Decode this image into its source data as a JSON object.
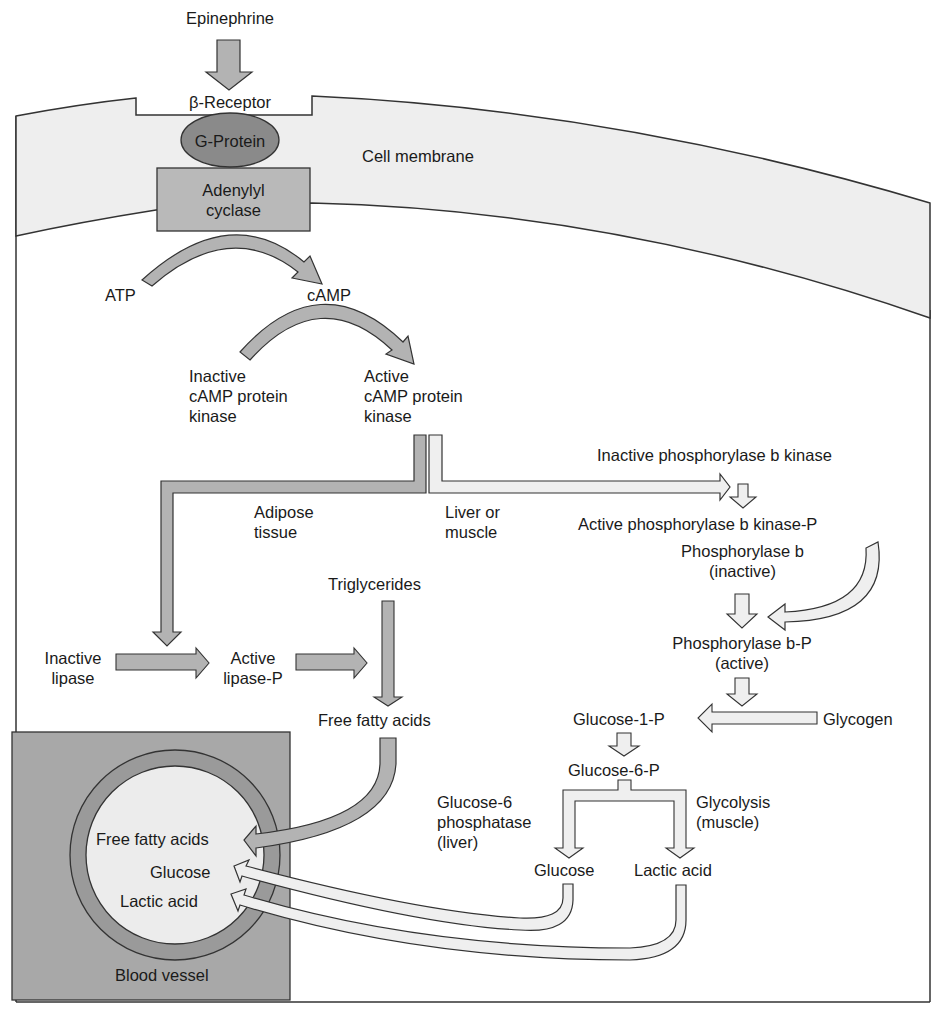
{
  "figure": {
    "colors": {
      "membrane": "#eeeeee",
      "g_protein": "#8a8a8a",
      "adenylyl_cyclase": "#b9b9b9",
      "dark_arrow": "#b3b3b3",
      "light_arrow": "#efefef",
      "blood_vessel_bg": "#a8a8a8",
      "vessel_ring": "#9a9a9a",
      "vessel_lumen": "#ececec",
      "outline": "#333333"
    }
  },
  "labels": {
    "epinephrine": "Epinephrine",
    "beta_receptor": "β-Receptor",
    "g_protein": "G-Protein",
    "adenylyl_cyclase": "Adenylyl\ncyclase",
    "cell_membrane": "Cell membrane",
    "atp": "ATP",
    "camp": "cAMP",
    "inactive_camp_kinase": "Inactive\ncAMP protein\nkinase",
    "active_camp_kinase": "Active\ncAMP protein\nkinase",
    "adipose_tissue": "Adipose\ntissue",
    "liver_or_muscle": "Liver or\nmuscle",
    "inactive_phosphorylase_b_kinase": "Inactive phosphorylase b kinase",
    "active_phosphorylase_b_kinase_p": "Active phosphorylase b kinase-P",
    "phosphorylase_b_inactive": "Phosphorylase b\n(inactive)",
    "phosphorylase_b_p_active": "Phosphorylase b-P\n(active)",
    "triglycerides": "Triglycerides",
    "inactive_lipase": "Inactive\nlipase",
    "active_lipase_p": "Active\nlipase-P",
    "free_fatty_acids": "Free fatty acids",
    "glucose_1_p": "Glucose-1-P",
    "glycogen": "Glycogen",
    "glucose_6_p": "Glucose-6-P",
    "glucose_6_phosphatase": "Glucose-6\nphosphatase\n(liver)",
    "glycolysis": "Glycolysis\n(muscle)",
    "glucose": "Glucose",
    "lactic_acid": "Lactic acid",
    "vessel_free_fatty_acids": "Free fatty acids",
    "vessel_glucose": "Glucose",
    "vessel_lactic_acid": "Lactic acid",
    "blood_vessel": "Blood vessel"
  }
}
